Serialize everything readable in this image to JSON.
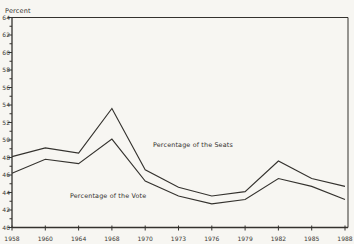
{
  "page": {
    "background_color": "#f7f6f2",
    "ink_color": "#34322e"
  },
  "chart_data": {
    "type": "line",
    "title": "",
    "ylabel": "Percent",
    "xlabel": "",
    "grid": false,
    "legend_position": "none (inline text annotations)",
    "y_axis": {
      "label": "Percent",
      "min": 40,
      "max": 64,
      "major_step": 2,
      "minor_step": 1,
      "tick_labels": [
        "40",
        "42",
        "44",
        "46",
        "48",
        "50",
        "52",
        "54",
        "56",
        "58",
        "60",
        "62",
        "64"
      ]
    },
    "x_axis": {
      "categories": [
        "1958",
        "1960",
        "1964",
        "1968",
        "1970",
        "1973",
        "1976",
        "1979",
        "1982",
        "1985",
        "1988"
      ]
    },
    "series": [
      {
        "name": "Percentage of the Seats",
        "values": [
          48.1,
          49.1,
          48.5,
          53.6,
          46.6,
          44.6,
          43.6,
          44.1,
          47.6,
          45.6,
          44.7
        ]
      },
      {
        "name": "Percentage of the Vote",
        "values": [
          46.2,
          47.8,
          47.3,
          50.1,
          45.3,
          43.6,
          42.7,
          43.2,
          45.6,
          44.7,
          43.2
        ]
      }
    ],
    "annotations": [
      {
        "text": "Percentage of the Seats",
        "x": 153,
        "y": 147
      },
      {
        "text": "Percentage of the Vote",
        "x": 70,
        "y": 198
      }
    ]
  }
}
